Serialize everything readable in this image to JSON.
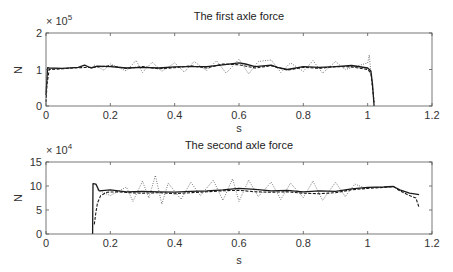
{
  "figure": {
    "width": 453,
    "height": 272
  },
  "chart_data": [
    {
      "type": "line",
      "title": "The first axle force",
      "xlabel": "s",
      "ylabel": "N",
      "exponent_label": "× 10",
      "exponent_power": "5",
      "xlim": [
        0,
        1.2
      ],
      "ylim": [
        0,
        200000
      ],
      "xticks": [
        0,
        0.2,
        0.4,
        0.6,
        0.8,
        1,
        1.2
      ],
      "xtick_labels": [
        "0",
        "0.2",
        "0.4",
        "0.6",
        "0.8",
        "1",
        "1.2"
      ],
      "yticks": [
        0,
        100000,
        200000
      ],
      "ytick_labels": [
        "0",
        "1",
        "2"
      ],
      "grid": false,
      "legend": null,
      "series": [
        {
          "name": "solid",
          "style": "solid",
          "x": [
            0.0,
            0.005,
            0.01,
            0.05,
            0.1,
            0.12,
            0.14,
            0.16,
            0.2,
            0.25,
            0.3,
            0.35,
            0.4,
            0.45,
            0.5,
            0.55,
            0.6,
            0.62,
            0.65,
            0.7,
            0.72,
            0.75,
            0.8,
            0.85,
            0.9,
            0.95,
            1.0,
            1.01,
            1.015,
            1.02
          ],
          "y": [
            30000,
            105000,
            104000,
            103000,
            106000,
            112000,
            104000,
            109000,
            108000,
            104000,
            106000,
            104000,
            107000,
            108000,
            108000,
            113000,
            118000,
            115000,
            108000,
            112000,
            106000,
            100000,
            108000,
            106000,
            108000,
            111000,
            104000,
            96000,
            60000,
            0
          ]
        },
        {
          "name": "dashed",
          "style": "dashed",
          "x": [
            0.0,
            0.003,
            0.01,
            0.05,
            0.1,
            0.15,
            0.2,
            0.25,
            0.3,
            0.35,
            0.4,
            0.45,
            0.5,
            0.55,
            0.6,
            0.65,
            0.7,
            0.75,
            0.8,
            0.85,
            0.9,
            0.95,
            1.0,
            1.01,
            1.02
          ],
          "y": [
            10000,
            60000,
            100000,
            102000,
            105000,
            106000,
            110000,
            103000,
            108000,
            102000,
            105000,
            110000,
            104000,
            115000,
            113000,
            104000,
            110000,
            98000,
            106000,
            103000,
            108000,
            107000,
            100000,
            90000,
            10000
          ]
        },
        {
          "name": "dotted",
          "style": "dotted",
          "x": [
            0.15,
            0.18,
            0.2,
            0.25,
            0.28,
            0.3,
            0.33,
            0.36,
            0.4,
            0.43,
            0.46,
            0.5,
            0.53,
            0.56,
            0.6,
            0.63,
            0.66,
            0.7,
            0.73,
            0.76,
            0.8,
            0.83,
            0.86,
            0.9,
            0.93,
            1.0,
            1.005,
            1.01
          ],
          "y": [
            112000,
            98000,
            115000,
            96000,
            125000,
            92000,
            120000,
            95000,
            118000,
            93000,
            122000,
            97000,
            124000,
            90000,
            128000,
            88000,
            122000,
            126000,
            92000,
            118000,
            95000,
            124000,
            90000,
            122000,
            100000,
            118000,
            140000,
            88000
          ]
        }
      ]
    },
    {
      "type": "line",
      "title": "The second axle force",
      "xlabel": "s",
      "ylabel": "N",
      "exponent_label": "× 10",
      "exponent_power": "4",
      "xlim": [
        0,
        1.2
      ],
      "ylim": [
        0,
        150000
      ],
      "xticks": [
        0,
        0.2,
        0.4,
        0.6,
        0.8,
        1,
        1.2
      ],
      "xtick_labels": [
        "0",
        "0.2",
        "0.4",
        "0.6",
        "0.8",
        "1",
        "1.2"
      ],
      "yticks": [
        0,
        50000,
        100000,
        150000
      ],
      "ytick_labels": [
        "0",
        "5",
        "10",
        "15"
      ],
      "grid": false,
      "legend": null,
      "series": [
        {
          "name": "solid",
          "style": "solid",
          "x": [
            0.145,
            0.146,
            0.155,
            0.165,
            0.2,
            0.25,
            0.3,
            0.35,
            0.4,
            0.45,
            0.5,
            0.55,
            0.6,
            0.65,
            0.7,
            0.75,
            0.8,
            0.85,
            0.9,
            0.95,
            1.0,
            1.05,
            1.08,
            1.1,
            1.13,
            1.16
          ],
          "y": [
            0,
            105000,
            104000,
            90000,
            92000,
            88000,
            89000,
            88000,
            87000,
            89000,
            90000,
            92000,
            95000,
            93000,
            90000,
            91000,
            88000,
            90000,
            89000,
            94000,
            97000,
            98000,
            99000,
            92000,
            85000,
            82000
          ]
        },
        {
          "name": "dashed",
          "style": "dashed",
          "x": [
            0.15,
            0.155,
            0.16,
            0.17,
            0.19,
            0.22,
            0.26,
            0.3,
            0.35,
            0.4,
            0.45,
            0.5,
            0.55,
            0.6,
            0.65,
            0.7,
            0.75,
            0.8,
            0.85,
            0.9,
            0.95,
            1.0,
            1.05,
            1.08,
            1.1,
            1.13,
            1.15,
            1.16
          ],
          "y": [
            20000,
            45000,
            65000,
            80000,
            87000,
            88000,
            86000,
            85000,
            86000,
            84000,
            86000,
            88000,
            90000,
            91000,
            88000,
            87000,
            88000,
            85000,
            84000,
            86000,
            92000,
            95000,
            97000,
            99000,
            90000,
            80000,
            75000,
            55000
          ]
        },
        {
          "name": "dotted",
          "style": "dotted",
          "x": [
            0.16,
            0.2,
            0.25,
            0.27,
            0.3,
            0.32,
            0.34,
            0.36,
            0.38,
            0.42,
            0.45,
            0.48,
            0.52,
            0.55,
            0.58,
            0.6,
            0.63,
            0.66,
            0.7,
            0.73,
            0.76,
            0.8,
            0.83,
            0.86,
            0.9,
            0.93,
            0.96,
            1.0
          ],
          "y": [
            92000,
            80000,
            98000,
            68000,
            110000,
            75000,
            122000,
            62000,
            106000,
            72000,
            108000,
            80000,
            112000,
            70000,
            115000,
            68000,
            112000,
            78000,
            108000,
            72000,
            106000,
            76000,
            110000,
            70000,
            108000,
            78000,
            104000,
            94000
          ]
        }
      ]
    }
  ]
}
